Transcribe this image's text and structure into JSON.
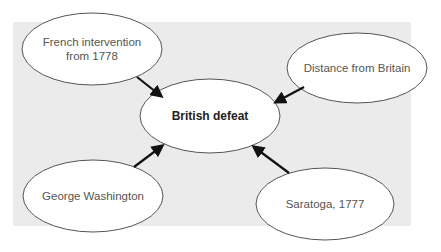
{
  "diagram": {
    "center": {
      "label": "British defeat",
      "cx": 210,
      "cy": 116,
      "rx": 70,
      "ry": 37
    },
    "causes": [
      {
        "id": "french",
        "label": "French intervention from 1778",
        "cx": 92,
        "cy": 49,
        "rx": 70,
        "ry": 36
      },
      {
        "id": "distance",
        "label": "Distance from Britain",
        "cx": 357,
        "cy": 68,
        "rx": 70,
        "ry": 35
      },
      {
        "id": "washington",
        "label": "George Washington",
        "cx": 93,
        "cy": 196,
        "rx": 70,
        "ry": 36
      },
      {
        "id": "saratoga",
        "label": "Saratoga, 1777",
        "cx": 325,
        "cy": 204,
        "rx": 69,
        "ry": 36
      }
    ],
    "arrows": [
      {
        "from": "french",
        "to": "center",
        "x1": 137,
        "y1": 77,
        "x2": 161,
        "y2": 96
      },
      {
        "from": "distance",
        "to": "center",
        "x1": 304,
        "y1": 87,
        "x2": 276,
        "y2": 102
      },
      {
        "from": "washington",
        "to": "center",
        "x1": 134,
        "y1": 167,
        "x2": 162,
        "y2": 146
      },
      {
        "from": "saratoga",
        "to": "center",
        "x1": 289,
        "y1": 173,
        "x2": 254,
        "y2": 147
      }
    ],
    "colors": {
      "panel": "#ebebeb",
      "ellipse_fill": "#ffffff",
      "ellipse_stroke": "#555555",
      "arrow": "#111111"
    }
  }
}
